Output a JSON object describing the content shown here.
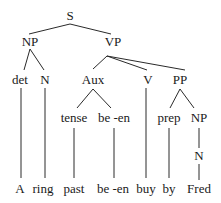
{
  "diagram": {
    "type": "syntax-tree",
    "nodes": [
      {
        "id": "S",
        "label": "S",
        "x": 70,
        "y": 20
      },
      {
        "id": "NP1",
        "label": "NP",
        "x": 30,
        "y": 46
      },
      {
        "id": "VP",
        "label": "VP",
        "x": 113,
        "y": 46
      },
      {
        "id": "det",
        "label": "det",
        "x": 20,
        "y": 84
      },
      {
        "id": "N1",
        "label": "N",
        "x": 45,
        "y": 84
      },
      {
        "id": "Aux",
        "label": "Aux",
        "x": 93,
        "y": 84
      },
      {
        "id": "V",
        "label": "V",
        "x": 148,
        "y": 84
      },
      {
        "id": "PP",
        "label": "PP",
        "x": 180,
        "y": 84
      },
      {
        "id": "tense",
        "label": "tense",
        "x": 74,
        "y": 122
      },
      {
        "id": "been1",
        "label": "be -en",
        "x": 114,
        "y": 122
      },
      {
        "id": "prep",
        "label": "prep",
        "x": 169,
        "y": 122
      },
      {
        "id": "NP2",
        "label": "NP",
        "x": 199,
        "y": 122
      },
      {
        "id": "N2",
        "label": "N",
        "x": 199,
        "y": 160
      },
      {
        "id": "A",
        "label": "A",
        "x": 20,
        "y": 193
      },
      {
        "id": "ring",
        "label": "ring",
        "x": 43,
        "y": 193
      },
      {
        "id": "past",
        "label": "past",
        "x": 74,
        "y": 193
      },
      {
        "id": "been2",
        "label": "be -en",
        "x": 113,
        "y": 193
      },
      {
        "id": "buy",
        "label": "buy",
        "x": 146,
        "y": 193
      },
      {
        "id": "by",
        "label": "by",
        "x": 169,
        "y": 193
      },
      {
        "id": "Fred",
        "label": "Fred",
        "x": 199,
        "y": 193
      }
    ],
    "edges": [
      {
        "from": "S",
        "to": "NP1",
        "x1": 70,
        "y1": 24,
        "x2": 29,
        "y2": 34
      },
      {
        "from": "S",
        "to": "VP",
        "x1": 70,
        "y1": 24,
        "x2": 111,
        "y2": 34
      },
      {
        "from": "NP1",
        "to": "det",
        "x1": 30,
        "y1": 49,
        "x2": 24,
        "y2": 70
      },
      {
        "from": "NP1",
        "to": "N1",
        "x1": 30,
        "y1": 49,
        "x2": 44,
        "y2": 70
      },
      {
        "from": "VP",
        "to": "Aux",
        "x1": 107,
        "y1": 56,
        "x2": 93,
        "y2": 69
      },
      {
        "from": "VP",
        "to": "V",
        "x1": 107,
        "y1": 56,
        "x2": 147,
        "y2": 70
      },
      {
        "from": "VP",
        "to": "PP",
        "x1": 107,
        "y1": 56,
        "x2": 185,
        "y2": 70
      },
      {
        "from": "det",
        "to": "A",
        "x1": 21,
        "y1": 88,
        "x2": 21,
        "y2": 178
      },
      {
        "from": "N1",
        "to": "ring",
        "x1": 45,
        "y1": 88,
        "x2": 45,
        "y2": 178
      },
      {
        "from": "Aux",
        "to": "tense",
        "x1": 93,
        "y1": 89,
        "x2": 77,
        "y2": 108
      },
      {
        "from": "Aux",
        "to": "been1",
        "x1": 93,
        "y1": 89,
        "x2": 111,
        "y2": 108
      },
      {
        "from": "V",
        "to": "buy",
        "x1": 146,
        "y1": 88,
        "x2": 146,
        "y2": 178
      },
      {
        "from": "PP",
        "to": "prep",
        "x1": 180,
        "y1": 89,
        "x2": 170,
        "y2": 108
      },
      {
        "from": "PP",
        "to": "NP2",
        "x1": 180,
        "y1": 89,
        "x2": 194,
        "y2": 108
      },
      {
        "from": "tense",
        "to": "past",
        "x1": 74,
        "y1": 128,
        "x2": 74,
        "y2": 178
      },
      {
        "from": "been1",
        "to": "been2",
        "x1": 114,
        "y1": 128,
        "x2": 114,
        "y2": 178
      },
      {
        "from": "prep",
        "to": "by",
        "x1": 169,
        "y1": 128,
        "x2": 169,
        "y2": 178
      },
      {
        "from": "NP2",
        "to": "N2",
        "x1": 199,
        "y1": 128,
        "x2": 199,
        "y2": 148
      },
      {
        "from": "N2",
        "to": "Fred",
        "x1": 199,
        "y1": 164,
        "x2": 199,
        "y2": 180
      }
    ]
  }
}
